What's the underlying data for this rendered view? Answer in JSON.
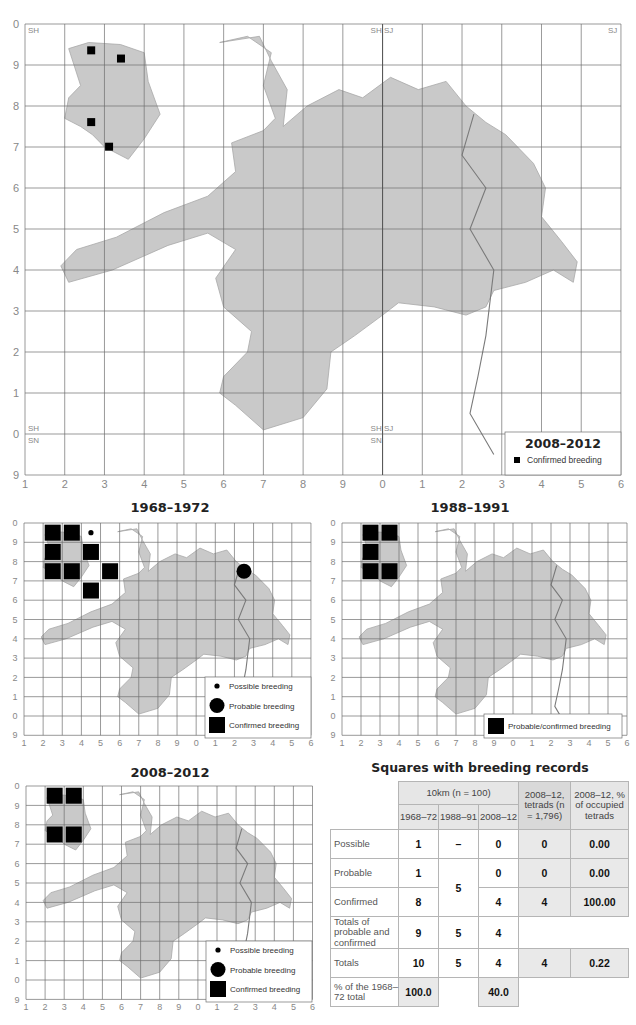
{
  "main_map": {
    "legend_title": "2008–2012",
    "legend_items": [
      {
        "symbol": "small-square",
        "label": "Confirmed breeding"
      }
    ],
    "x_ticks": [
      "1",
      "2",
      "3",
      "4",
      "5",
      "6",
      "7",
      "8",
      "9",
      "0",
      "1",
      "2",
      "3",
      "4",
      "5",
      "6"
    ],
    "y_ticks": [
      "0",
      "9",
      "8",
      "7",
      "6",
      "5",
      "4",
      "3",
      "2",
      "1",
      "0",
      "9"
    ],
    "grid_codes": [
      {
        "text": "SH",
        "pos": "top-left"
      },
      {
        "text": "SH SJ",
        "pos": "top-center"
      },
      {
        "text": "SJ",
        "pos": "top-right"
      },
      {
        "text": "SH",
        "pos": "bottom-left-upper"
      },
      {
        "text": "SN",
        "pos": "bottom-left-lower"
      },
      {
        "text": "SH SJ",
        "pos": "bottom-center-upper"
      },
      {
        "text": "SN",
        "pos": "bottom-center-lower"
      }
    ],
    "records": [
      {
        "col": 1,
        "row": 0.35,
        "type": "confirmed"
      },
      {
        "col": 2,
        "row": 0.55,
        "type": "confirmed"
      },
      {
        "col": 1,
        "row": 2.1,
        "type": "confirmed"
      },
      {
        "col": 1.6,
        "row": 2.7,
        "type": "confirmed"
      }
    ]
  },
  "small_maps": [
    {
      "title": "1968–1972",
      "legend_items": [
        {
          "symbol": "dot-small",
          "label": "Possible breeding"
        },
        {
          "symbol": "dot-large",
          "label": "Probable breeding"
        },
        {
          "symbol": "square",
          "label": "Confirmed breeding"
        }
      ],
      "records": [
        {
          "col": 1,
          "row": 0,
          "type": "confirmed"
        },
        {
          "col": 2,
          "row": 0,
          "type": "confirmed"
        },
        {
          "col": 3,
          "row": 0,
          "type": "possible"
        },
        {
          "col": 1,
          "row": 1,
          "type": "confirmed"
        },
        {
          "col": 3,
          "row": 1,
          "type": "confirmed"
        },
        {
          "col": 1,
          "row": 2,
          "type": "confirmed"
        },
        {
          "col": 2,
          "row": 2,
          "type": "confirmed"
        },
        {
          "col": 4,
          "row": 2,
          "type": "confirmed"
        },
        {
          "col": 3,
          "row": 3,
          "type": "confirmed"
        },
        {
          "col": 11,
          "row": 2,
          "type": "probable"
        }
      ]
    },
    {
      "title": "1988–1991",
      "legend_items": [
        {
          "symbol": "square",
          "label": "Probable/confirmed breeding"
        }
      ],
      "records": [
        {
          "col": 1,
          "row": 0,
          "type": "confirmed"
        },
        {
          "col": 2,
          "row": 0,
          "type": "confirmed"
        },
        {
          "col": 1,
          "row": 1,
          "type": "confirmed"
        },
        {
          "col": 1,
          "row": 2,
          "type": "confirmed"
        },
        {
          "col": 2,
          "row": 2,
          "type": "confirmed"
        }
      ]
    },
    {
      "title": "2008–2012",
      "legend_items": [
        {
          "symbol": "dot-small",
          "label": "Possible breeding"
        },
        {
          "symbol": "dot-large",
          "label": "Probable breeding"
        },
        {
          "symbol": "square",
          "label": "Confirmed breeding"
        }
      ],
      "records": [
        {
          "col": 1,
          "row": 0,
          "type": "confirmed"
        },
        {
          "col": 2,
          "row": 0,
          "type": "confirmed"
        },
        {
          "col": 1,
          "row": 2,
          "type": "confirmed"
        },
        {
          "col": 2,
          "row": 2,
          "type": "confirmed"
        }
      ]
    }
  ],
  "table": {
    "title": "Squares with breeding records",
    "header_group": "10km (n = 100)",
    "header_tetrads": "2008–12, tetrads (n = 1,796)",
    "header_pct": "2008–12, % of occupied tetrads",
    "sub_headers": [
      "1968–72",
      "1988–91",
      "2008–12"
    ],
    "rows": [
      {
        "label": "Possible",
        "c1": "1",
        "c2": "–",
        "c3": "0",
        "tetrads": "0",
        "pct": "0.00"
      },
      {
        "label": "Probable",
        "c1": "1",
        "c2": "5",
        "c3": "0",
        "tetrads": "0",
        "pct": "0.00"
      },
      {
        "label": "Confirmed",
        "c1": "8",
        "c3": "4",
        "tetrads": "4",
        "pct": "100.00"
      },
      {
        "label": "Totals of probable and confirmed",
        "c1": "9",
        "c2": "5",
        "c3": "4"
      },
      {
        "label": "Totals",
        "c1": "10",
        "c2": "5",
        "c3": "4",
        "tetrads": "4",
        "pct": "0.22"
      },
      {
        "label": "% of the 1968–72 total",
        "c1": "100.0",
        "c3": "40.0"
      }
    ]
  },
  "colors": {
    "land": "#c9c9c9",
    "land_dark": "#a8a8a8",
    "grid": "#6f6f6f",
    "marker": "#000000",
    "border": "#7a7a7a"
  }
}
